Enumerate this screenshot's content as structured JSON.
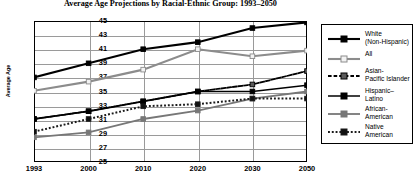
{
  "chart_data": {
    "type": "line",
    "title": "Average Age Projections by Racial-Ethnic Group: 1993–2050",
    "xlabel": "",
    "ylabel": "Average Age",
    "categories": [
      "1993",
      "2000",
      "2010",
      "2020",
      "2030",
      "2050"
    ],
    "ylim": [
      25,
      45
    ],
    "ytick_step": 2,
    "yticks": [
      "45",
      "43",
      "41",
      "39",
      "37",
      "35",
      "33",
      "31",
      "29",
      "27",
      "25"
    ],
    "grid": "horizontal-and-vertical",
    "legend_position": "right",
    "series": [
      {
        "name": "White\n(Non-Hispanic)",
        "values": [
          37.0,
          39.0,
          41.0,
          42.0,
          44.0,
          44.8
        ],
        "color": "#000000",
        "line_style": "solid",
        "line_width": 2.1,
        "marker": "filled-square",
        "marker_fill": "#000000"
      },
      {
        "name": "All",
        "values": [
          35.1,
          36.4,
          38.1,
          41.0,
          40.0,
          40.8
        ],
        "color": "#8c8c8c",
        "line_style": "solid",
        "line_width": 2.1,
        "marker": "open-square",
        "marker_fill": "#f2f2f2"
      },
      {
        "name": "Asian-\nPacific Islander",
        "values": [
          31.1,
          32.2,
          33.6,
          35.0,
          36.0,
          37.9
        ],
        "color": "#000000",
        "line_style": "dashed",
        "line_width": 1.8,
        "marker": "filled-square",
        "marker_fill": "#5a5a5a"
      },
      {
        "name": "Hispanic–\nLatino",
        "values": [
          31.1,
          32.2,
          33.6,
          35.0,
          35.0,
          35.9
        ],
        "color": "#000000",
        "line_style": "solid",
        "line_width": 1.5,
        "marker": "filled-square",
        "marker_fill": "#000000"
      },
      {
        "name": "African-\nAmerican",
        "values": [
          28.5,
          29.2,
          31.1,
          32.3,
          34.0,
          35.0
        ],
        "color": "#777777",
        "line_style": "solid",
        "line_width": 1.8,
        "marker": "filled-square",
        "marker_fill": "#777777"
      },
      {
        "name": "Native\nAmerican",
        "values": [
          29.3,
          31.1,
          32.9,
          33.2,
          34.0,
          34.0
        ],
        "color": "#1a1a1a",
        "line_style": "dotted",
        "line_width": 2.0,
        "marker": "filled-square",
        "marker_fill": "#111111"
      }
    ]
  },
  "legend": {
    "entries": [
      {
        "label": "White\n(Non-Hispanic)"
      },
      {
        "label": "All"
      },
      {
        "label": "Asian-\nPacific Islander"
      },
      {
        "label": "Hispanic–\nLatino"
      },
      {
        "label": "African-\nAmerican"
      },
      {
        "label": "Native\nAmerican"
      }
    ]
  }
}
